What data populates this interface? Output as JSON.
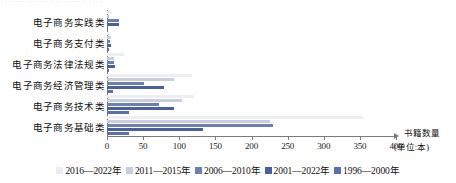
{
  "chart_data": {
    "type": "bar",
    "orientation": "horizontal",
    "title": "",
    "xlabel": "书籍数量(单位:本)",
    "ylabel": "",
    "xlim": [
      0,
      400
    ],
    "xticks": [
      0,
      50,
      100,
      150,
      200,
      250,
      300,
      350,
      400
    ],
    "xtick_labels": [
      "0",
      "50",
      "100",
      "150",
      "200",
      "250",
      "300",
      "350",
      "400"
    ],
    "grid": false,
    "legend_position": "bottom",
    "categories": [
      "电子商务基础类",
      "电子商务技术类",
      "电子商务经济管理类",
      "电子商务法律法规类",
      "电子商务支付类",
      "电子商务实践类"
    ],
    "series": [
      {
        "name": "2016—2022年",
        "color": "#eceef4",
        "values": [
          355,
          120,
          117,
          24,
          4,
          5
        ]
      },
      {
        "name": "2011—2015年",
        "color": "#c8cee0",
        "values": [
          225,
          104,
          93,
          9,
          5,
          3
        ]
      },
      {
        "name": "2006—2010年",
        "color": "#6b7fb5",
        "values": [
          230,
          72,
          51,
          9,
          4,
          16
        ]
      },
      {
        "name": "2001—2022年",
        "color": "#4a5f9e",
        "values": [
          133,
          93,
          79,
          11,
          5,
          17
        ]
      },
      {
        "name": "1996—2000年",
        "color": "#5b6fa8",
        "values": [
          31,
          31,
          8,
          3,
          3,
          2
        ]
      }
    ]
  },
  "axis": {
    "unit_label_top": "书籍数量",
    "unit_label_bottom": "(单位:本)"
  },
  "decoration": {
    "top_strip_text": "· · ·· ··· ·· · ·· ··· ·· ·· ··· ·· · ·· ·"
  }
}
